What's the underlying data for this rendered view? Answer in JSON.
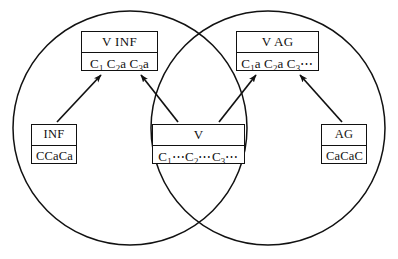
{
  "diagram": {
    "type": "venn-diagram",
    "title": "",
    "stroke_color": "#111111",
    "fill_color": "#ffffff",
    "sets": [
      {
        "id": "left-circle",
        "label": "",
        "cx": 130,
        "cy": 128,
        "r": 117
      },
      {
        "id": "right-circle",
        "label": "",
        "cx": 268,
        "cy": 128,
        "r": 117
      }
    ],
    "nodes": [
      {
        "id": "v-inf",
        "title": "V INF",
        "content_plain": "C1 C2 a C3 a",
        "region": "left-only"
      },
      {
        "id": "v-ag",
        "title": "V AG",
        "content_plain": "C1 a C2 a C3 ⋯",
        "region": "right-only"
      },
      {
        "id": "inf",
        "title": "INF",
        "content_plain": "CCaCa",
        "region": "left-only"
      },
      {
        "id": "v",
        "title": "V",
        "content_plain": "C1 ⋯ C2 ⋯ C3 ⋯",
        "region": "intersection"
      },
      {
        "id": "ag",
        "title": "AG",
        "content_plain": "CaCaC",
        "region": "right-only"
      }
    ],
    "edges": [
      {
        "from": "inf",
        "to": "v-inf",
        "arrow": "to"
      },
      {
        "from": "v",
        "to": "v-inf",
        "arrow": "to"
      },
      {
        "from": "v",
        "to": "v-ag",
        "arrow": "to"
      },
      {
        "from": "ag",
        "to": "v-ag",
        "arrow": "to"
      }
    ]
  },
  "labels": {
    "v_inf_title": "V INF",
    "v_ag_title": "V AG",
    "inf_title": "INF",
    "v_title": "V",
    "ag_title": "AG",
    "inf_content": "CCaCa",
    "ag_content": "CaCaC",
    "c_symbol": "C",
    "a_symbol": "a",
    "sub_1": "1",
    "sub_2": "2",
    "sub_3": "3",
    "ellipsis": "⋯"
  }
}
